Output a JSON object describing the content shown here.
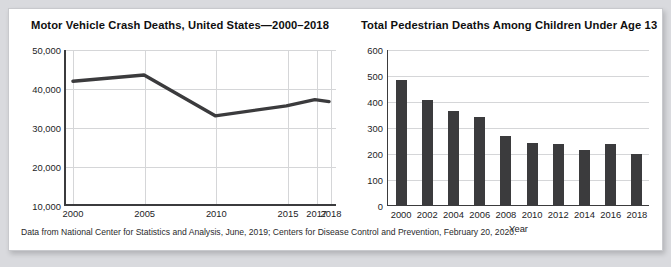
{
  "figure": {
    "caption": "Data from National Center for Statistics and Analysis, June, 2019; Centers for Disease Control and Prevention, February 20, 2020."
  },
  "colors": {
    "ink": "#3b3b3d",
    "grid": "#d5d6d8",
    "card": "#ffffff",
    "page": "#d9dade"
  },
  "chart_data": [
    {
      "type": "line",
      "title": "Motor Vehicle Crash Deaths, United States—2000–2018",
      "xlabel": "",
      "ylabel": "",
      "categories": [
        "2000",
        "2005",
        "2010",
        "2015",
        "2017",
        "2018"
      ],
      "x": [
        2000,
        2005,
        2010,
        2015,
        2017,
        2018
      ],
      "values": [
        41900,
        43500,
        32900,
        35500,
        37100,
        36600
      ],
      "ylim": [
        10000,
        50000
      ],
      "yticks": [
        10000,
        20000,
        30000,
        40000,
        50000
      ],
      "ytick_labels": [
        "10,000",
        "20,000",
        "30,000",
        "40,000",
        "50,000"
      ],
      "xtick_labels": [
        "2000",
        "2005",
        "2010",
        "2015",
        "2017",
        "2018"
      ],
      "grid": true,
      "legend": "none"
    },
    {
      "type": "bar",
      "title": "Total Pedestrian Deaths Among Children Under Age 13",
      "xlabel": "Year",
      "ylabel": "",
      "categories": [
        "2000",
        "2002",
        "2004",
        "2006",
        "2008",
        "2010",
        "2012",
        "2014",
        "2016",
        "2018"
      ],
      "values": [
        480,
        405,
        362,
        338,
        265,
        240,
        235,
        210,
        235,
        195
      ],
      "ylim": [
        0,
        600
      ],
      "yticks": [
        0,
        100,
        200,
        300,
        400,
        500,
        600
      ],
      "ytick_labels": [
        "0",
        "100",
        "200",
        "300",
        "400",
        "500",
        "600"
      ],
      "grid": true,
      "legend": "none"
    }
  ]
}
